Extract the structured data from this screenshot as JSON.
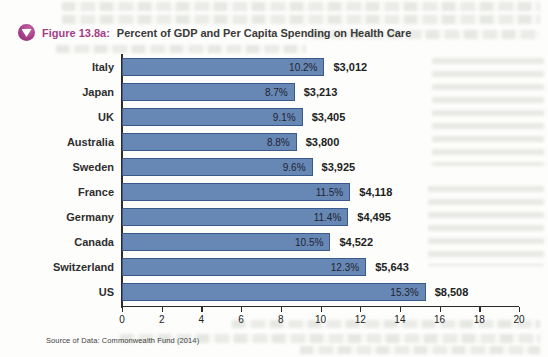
{
  "figure": {
    "label": "Figure 13.8a:",
    "title": "Percent of GDP and Per Capita Spending on Health Care",
    "source": "Source of Data: Commonwealth Fund (2014)"
  },
  "colors": {
    "accent": "#a63d87",
    "bar_fill": "#6787b5",
    "bar_border": "#3a5a8c",
    "axis_line": "#2b2b2b",
    "label_text": "#2e2e2e",
    "value_text": "#222222"
  },
  "chart_data": {
    "type": "bar",
    "orientation": "horizontal",
    "title": "Percent of GDP and Per Capita Spending on Health Care",
    "categories": [
      "Italy",
      "Japan",
      "UK",
      "Australia",
      "Sweden",
      "France",
      "Germany",
      "Canada",
      "Switzerland",
      "US"
    ],
    "series": [
      {
        "name": "Percent of GDP",
        "unit": "%",
        "values": [
          10.2,
          8.7,
          9.1,
          8.8,
          9.6,
          11.5,
          11.4,
          10.5,
          12.3,
          15.3
        ],
        "labels": [
          "10.2%",
          "8.7%",
          "9.1%",
          "8.8%",
          "9.6%",
          "11.5%",
          "11.4%",
          "10.5%",
          "12.3%",
          "15.3%"
        ]
      },
      {
        "name": "Per Capita Spending",
        "unit": "USD",
        "values": [
          3012,
          3213,
          3405,
          3800,
          3925,
          4118,
          4495,
          4522,
          5643,
          8508
        ],
        "labels": [
          "$3,012",
          "$3,213",
          "$3,405",
          "$3,800",
          "$3,925",
          "$4,118",
          "$4,495",
          "$4,522",
          "$5,643",
          "$8,508"
        ]
      }
    ],
    "xlim": [
      0,
      20
    ],
    "xticks": [
      0,
      2,
      4,
      6,
      8,
      10,
      12,
      14,
      16,
      18,
      20
    ],
    "grid": false,
    "legend": false,
    "bar_label_position": "inside-end",
    "source": "Source of Data: Commonwealth Fund (2014)"
  }
}
